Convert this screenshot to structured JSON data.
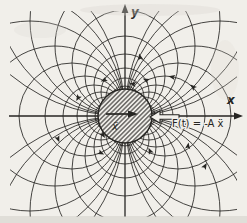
{
  "labels": {
    "x_axis": "x",
    "y_axis": "y",
    "acceleration": "ẍ",
    "force_equation": "F(t) = -A ẍ"
  },
  "colors": {
    "ink": "#262522",
    "paper": "#f1efea",
    "shadow": "#d2cfc9"
  },
  "diagram": {
    "center": {
      "x": 125,
      "y": 116
    },
    "body_radius": 27,
    "field_circle_radii": [
      15,
      19,
      24,
      31,
      40,
      53,
      70,
      95,
      130,
      180
    ],
    "families": [
      {
        "name": "right",
        "ux": 1,
        "uy": 0
      },
      {
        "name": "left",
        "ux": -1,
        "uy": 0
      },
      {
        "name": "up",
        "ux": 0,
        "uy": -1
      },
      {
        "name": "down",
        "ux": 0,
        "uy": 1
      }
    ],
    "clip": {
      "x": 10,
      "y": 11,
      "w": 227,
      "h": 206
    },
    "arrowheads": [
      {
        "x": 146,
        "y": 80,
        "rot": 205
      },
      {
        "x": 172,
        "y": 77,
        "rot": 190
      },
      {
        "x": 193,
        "y": 87,
        "rot": 222
      },
      {
        "x": 133,
        "y": 84,
        "rot": 192
      },
      {
        "x": 104,
        "y": 80,
        "rot": 155
      },
      {
        "x": 78,
        "y": 98,
        "rot": 120
      },
      {
        "x": 58,
        "y": 139,
        "rot": 68
      },
      {
        "x": 101,
        "y": 153,
        "rot": 25
      },
      {
        "x": 150,
        "y": 151,
        "rot": 245
      },
      {
        "x": 188,
        "y": 146,
        "rot": 278
      },
      {
        "x": 205,
        "y": 166,
        "rot": 300
      },
      {
        "x": 140,
        "y": 57,
        "rot": 255
      },
      {
        "x": 103,
        "y": 135,
        "rot": 55
      }
    ]
  }
}
